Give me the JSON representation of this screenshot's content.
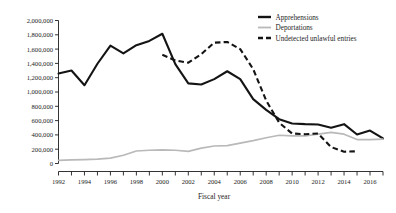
{
  "chart_data": {
    "type": "line",
    "title": "",
    "xlabel": "Fiscal year",
    "ylabel": "",
    "xlim": [
      1992,
      2017
    ],
    "ylim": [
      0,
      2000000
    ],
    "grid": false,
    "legend_position": "top-right",
    "y_ticks": [
      0,
      200000,
      400000,
      600000,
      800000,
      1000000,
      1200000,
      1400000,
      1600000,
      1800000,
      2000000
    ],
    "y_tick_labels": [
      "0",
      "200,000",
      "400,000",
      "600,000",
      "800,000",
      "1,000,000",
      "1,200,000",
      "1,400,000",
      "1,600,000",
      "1,800,000",
      "2,000,000"
    ],
    "x_ticks": [
      1992,
      1993,
      1994,
      1995,
      1996,
      1997,
      1998,
      1999,
      2000,
      2001,
      2002,
      2003,
      2004,
      2005,
      2006,
      2007,
      2008,
      2009,
      2010,
      2011,
      2012,
      2013,
      2014,
      2015,
      2016,
      2017
    ],
    "x_tick_labels": [
      "1992",
      "1994",
      "1996",
      "1998",
      "2000",
      "2002",
      "2004",
      "2006",
      "2008",
      "2010",
      "2012",
      "2014",
      "2016"
    ],
    "x_labeled_years": [
      1992,
      1994,
      1996,
      1998,
      2000,
      2002,
      2004,
      2006,
      2008,
      2010,
      2012,
      2014,
      2016
    ],
    "series": [
      {
        "name": "Apprehensions",
        "color": "#141414",
        "style": "solid",
        "x": [
          1992,
          1993,
          1994,
          1995,
          1996,
          1997,
          1998,
          1999,
          2000,
          2001,
          2002,
          2003,
          2004,
          2005,
          2006,
          2007,
          2008,
          2009,
          2010,
          2011,
          2012,
          2013,
          2014,
          2015,
          2016,
          2017
        ],
        "values": [
          1258000,
          1300000,
          1095000,
          1395000,
          1650000,
          1540000,
          1655000,
          1715000,
          1815000,
          1390000,
          1120000,
          1105000,
          1180000,
          1290000,
          1180000,
          900000,
          750000,
          620000,
          560000,
          550000,
          545000,
          500000,
          550000,
          405000,
          460000,
          350000
        ]
      },
      {
        "name": "Deportations",
        "color": "#b9b9b9",
        "style": "solid",
        "x": [
          1992,
          1993,
          1994,
          1995,
          1996,
          1997,
          1998,
          1999,
          2000,
          2001,
          2002,
          2003,
          2004,
          2005,
          2006,
          2007,
          2008,
          2009,
          2010,
          2011,
          2012,
          2013,
          2014,
          2015,
          2016,
          2017
        ],
        "values": [
          45000,
          50000,
          55000,
          60000,
          75000,
          115000,
          175000,
          185000,
          190000,
          185000,
          170000,
          215000,
          245000,
          250000,
          285000,
          320000,
          360000,
          395000,
          385000,
          385000,
          410000,
          435000,
          410000,
          335000,
          335000,
          340000
        ]
      },
      {
        "name": "Undetected unlawful entries",
        "color": "#141414",
        "style": "dashed",
        "x": [
          2000,
          2001,
          2002,
          2003,
          2004,
          2005,
          2006,
          2007,
          2008,
          2009,
          2010,
          2011,
          2012,
          2013,
          2014,
          2015
        ],
        "values": [
          1520000,
          1440000,
          1410000,
          1530000,
          1690000,
          1700000,
          1600000,
          1320000,
          880000,
          570000,
          420000,
          410000,
          420000,
          230000,
          165000,
          170000
        ]
      }
    ]
  },
  "legend": {
    "items": [
      {
        "label": "Apprehensions",
        "style": "solid",
        "color": "#141414"
      },
      {
        "label": "Deportations",
        "style": "solid",
        "color": "#b9b9b9"
      },
      {
        "label": "Undetected unlawful entries",
        "style": "dashed",
        "color": "#141414"
      }
    ]
  }
}
